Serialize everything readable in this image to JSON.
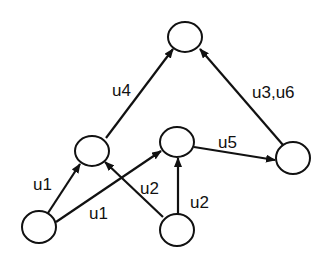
{
  "diagram": {
    "type": "directed-graph",
    "nodes": [
      {
        "id": "top",
        "cx": 185,
        "cy": 37,
        "rx": 17,
        "ry": 15
      },
      {
        "id": "left-mid",
        "cx": 92,
        "cy": 151,
        "rx": 17,
        "ry": 15
      },
      {
        "id": "center-mid",
        "cx": 177,
        "cy": 142,
        "rx": 17,
        "ry": 15
      },
      {
        "id": "right",
        "cx": 293,
        "cy": 158,
        "rx": 17,
        "ry": 16
      },
      {
        "id": "bottom-left",
        "cx": 39,
        "cy": 227,
        "rx": 17,
        "ry": 16
      },
      {
        "id": "bottom-center",
        "cx": 177,
        "cy": 230,
        "rx": 17,
        "ry": 16
      }
    ],
    "edges": [
      {
        "from": "bottom-left",
        "to": "left-mid",
        "label": "u1"
      },
      {
        "from": "bottom-left",
        "to": "center-mid",
        "label": "u1"
      },
      {
        "from": "bottom-center",
        "to": "left-mid",
        "label": "u2"
      },
      {
        "from": "bottom-center",
        "to": "center-mid",
        "label": "u2"
      },
      {
        "from": "left-mid",
        "to": "top",
        "label": "u4"
      },
      {
        "from": "center-mid",
        "to": "right",
        "label": "u5"
      },
      {
        "from": "right",
        "to": "top",
        "label": "u3,u6"
      }
    ],
    "labels": {
      "u1_left": "u1",
      "u1_bottom": "u1",
      "u2_mid": "u2",
      "u2_right": "u2",
      "u4": "u4",
      "u5": "u5",
      "u3u6": "u3,u6"
    }
  }
}
